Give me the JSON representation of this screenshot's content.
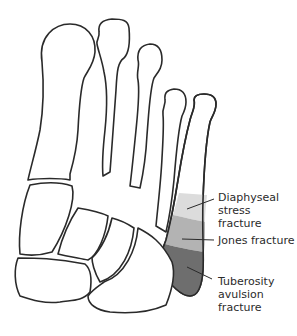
{
  "diagram": {
    "zones": [
      {
        "name": "Diaphyseal stress fracture",
        "label": "Diaphyseal\nstress fracture",
        "color": "#dcdcdc"
      },
      {
        "name": "Jones fracture",
        "label": "Jones fracture",
        "color": "#b3b3b3"
      },
      {
        "name": "Tuberosity avulsion fracture",
        "label": "Tuberosity\navulsion\nfracture",
        "color": "#6e6e6e"
      }
    ],
    "outline_color": "#2a2a2a"
  }
}
